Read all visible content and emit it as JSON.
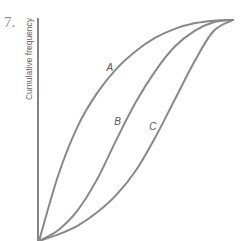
{
  "question_number": "7.",
  "chart_data": {
    "type": "line",
    "title": "",
    "xlabel": "",
    "ylabel": "Cumulative frequency",
    "x_ticks": [],
    "y_ticks": [],
    "xlim": [
      0,
      1
    ],
    "ylim": [
      0,
      1
    ],
    "grid": false,
    "legend": "none",
    "line_color": "#888888",
    "series": [
      {
        "name": "A",
        "shape": "concave (rises early)",
        "x": [
          0,
          0.1,
          0.2,
          0.3,
          0.4,
          0.5,
          0.6,
          0.7,
          0.8,
          0.9,
          1.0
        ],
        "y": [
          0,
          0.3,
          0.52,
          0.67,
          0.78,
          0.86,
          0.92,
          0.96,
          0.985,
          0.997,
          1.0
        ]
      },
      {
        "name": "B",
        "shape": "S-shaped",
        "x": [
          0,
          0.1,
          0.2,
          0.3,
          0.4,
          0.5,
          0.6,
          0.7,
          0.8,
          0.9,
          1.0
        ],
        "y": [
          0,
          0.05,
          0.14,
          0.28,
          0.46,
          0.63,
          0.77,
          0.88,
          0.95,
          0.99,
          1.0
        ]
      },
      {
        "name": "C",
        "shape": "convex (rises late)",
        "x": [
          0,
          0.1,
          0.2,
          0.3,
          0.4,
          0.5,
          0.6,
          0.7,
          0.8,
          0.9,
          1.0
        ],
        "y": [
          0,
          0.03,
          0.07,
          0.13,
          0.21,
          0.32,
          0.47,
          0.64,
          0.81,
          0.95,
          1.0
        ]
      }
    ],
    "annotations": [
      {
        "text": "A",
        "series": "A",
        "at_x": 0.41
      },
      {
        "text": "B",
        "series": "B",
        "at_x": 0.45
      },
      {
        "text": "C",
        "series": "C",
        "at_x": 0.63
      }
    ]
  }
}
